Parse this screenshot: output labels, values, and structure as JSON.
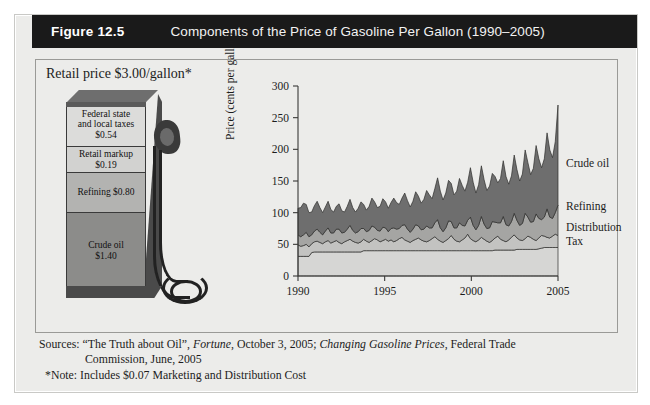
{
  "figure": {
    "number": "Figure 12.5",
    "title": "Components of the Price of Gasoline Per Gallon (1990–2005)"
  },
  "pump": {
    "retail_price_label": "Retail price $3.00/gallon*",
    "bands": [
      {
        "name": "tax",
        "line1": "Federal state",
        "line2": "and local taxes",
        "line3": "$0.54"
      },
      {
        "name": "markup",
        "line1": "Retail markup",
        "line2": "$0.19",
        "line3": ""
      },
      {
        "name": "refining",
        "line1": "Refining $0.80",
        "line2": "",
        "line3": ""
      },
      {
        "name": "crude",
        "line1": "Crude oil",
        "line2": "$1.40",
        "line3": ""
      }
    ]
  },
  "sources": {
    "line1_a": "Sources: “The Truth about Oil”, ",
    "line1_it1": "Fortune",
    "line1_b": ", October 3, 2005; ",
    "line1_it2": "Changing Gasoline Prices",
    "line1_c": ", Federal Trade",
    "line2": "Commission, June, 2005",
    "note": "*Note: Includes $0.07 Marketing and Distribution Cost"
  },
  "colors": {
    "crude": "#6e6e6e",
    "refining": "#a5a5a3",
    "distribution": "#c3c3c1",
    "tax": "#d6d6d4",
    "plot_bg": "#ececea",
    "axis": "#3a3a38",
    "title_bar": "#1a1a1a"
  },
  "chart_data": {
    "type": "area",
    "title": "Components of the Price of Gasoline Per Gallon (1990–2005)",
    "xlabel": "",
    "ylabel": "Price (cents per gallon)",
    "xlim": [
      1990,
      2005
    ],
    "ylim": [
      0,
      300
    ],
    "yticks": [
      0,
      50,
      100,
      150,
      200,
      250,
      300
    ],
    "xticks": [
      1990,
      1995,
      2000,
      2005
    ],
    "grid": false,
    "legend_position": "right-inline",
    "stacked": true,
    "series": [
      {
        "name": "Tax",
        "color": "#d6d6d4",
        "values": [
          31,
          31,
          31,
          31,
          31,
          37,
          38,
          38,
          38,
          38,
          38,
          38,
          38,
          38,
          38,
          38,
          38,
          38,
          38,
          38,
          38,
          38,
          38,
          38,
          40,
          40,
          40,
          40,
          40,
          40,
          40,
          40,
          40,
          40,
          40,
          40,
          40,
          40,
          40,
          40,
          40,
          40,
          40,
          40,
          40,
          40,
          40,
          40,
          40,
          40,
          40,
          40,
          40,
          40,
          40,
          40,
          40,
          40,
          40,
          40,
          40,
          40,
          40,
          40,
          40,
          40,
          40,
          40,
          40,
          40,
          40,
          40,
          41,
          41,
          41,
          41,
          41,
          41,
          41,
          41,
          42,
          42,
          42,
          42,
          42,
          42,
          42,
          42,
          43,
          44,
          45,
          45,
          45,
          45,
          45,
          45
        ]
      },
      {
        "name": "Distribution",
        "color": "#c3c3c1",
        "values": [
          18,
          16,
          17,
          19,
          15,
          14,
          16,
          17,
          15,
          13,
          16,
          18,
          14,
          16,
          18,
          15,
          13,
          16,
          18,
          20,
          17,
          15,
          14,
          16,
          18,
          15,
          13,
          16,
          19,
          17,
          14,
          16,
          18,
          15,
          17,
          14,
          16,
          19,
          21,
          17,
          15,
          13,
          16,
          18,
          20,
          17,
          15,
          14,
          16,
          19,
          22,
          18,
          15,
          13,
          16,
          19,
          24,
          18,
          15,
          14,
          17,
          20,
          26,
          19,
          16,
          14,
          17,
          21,
          18,
          15,
          13,
          16,
          19,
          22,
          17,
          15,
          13,
          16,
          20,
          24,
          18,
          15,
          14,
          17,
          21,
          19,
          16,
          14,
          17,
          20,
          18,
          16,
          15,
          18,
          21,
          19
        ]
      },
      {
        "name": "Refining",
        "color": "#a5a5a3",
        "values": [
          16,
          15,
          17,
          19,
          16,
          14,
          17,
          19,
          16,
          14,
          17,
          20,
          16,
          14,
          18,
          21,
          17,
          15,
          18,
          22,
          17,
          15,
          18,
          21,
          17,
          15,
          19,
          23,
          18,
          15,
          17,
          21,
          18,
          15,
          18,
          22,
          18,
          16,
          19,
          24,
          19,
          16,
          18,
          23,
          19,
          16,
          19,
          25,
          20,
          17,
          22,
          31,
          21,
          17,
          20,
          28,
          22,
          18,
          21,
          30,
          23,
          19,
          22,
          34,
          24,
          19,
          23,
          33,
          24,
          20,
          23,
          30,
          25,
          21,
          26,
          38,
          27,
          22,
          25,
          34,
          28,
          23,
          27,
          40,
          30,
          24,
          28,
          42,
          31,
          25,
          30,
          45,
          33,
          28,
          34,
          48
        ]
      },
      {
        "name": "Crude oil",
        "color": "#6e6e6e",
        "values": [
          42,
          46,
          50,
          44,
          38,
          36,
          40,
          44,
          39,
          35,
          38,
          42,
          37,
          33,
          36,
          40,
          35,
          32,
          36,
          41,
          36,
          33,
          37,
          42,
          38,
          34,
          38,
          44,
          40,
          36,
          39,
          45,
          41,
          37,
          41,
          47,
          42,
          38,
          43,
          50,
          45,
          40,
          44,
          52,
          47,
          42,
          47,
          56,
          52,
          46,
          54,
          66,
          58,
          50,
          55,
          64,
          60,
          52,
          58,
          70,
          63,
          55,
          60,
          78,
          68,
          58,
          64,
          80,
          70,
          60,
          66,
          76,
          72,
          63,
          70,
          88,
          76,
          66,
          72,
          92,
          80,
          70,
          78,
          100,
          86,
          75,
          84,
          108,
          94,
          82,
          92,
          120,
          106,
          96,
          112,
          158
        ]
      }
    ],
    "series_labels": [
      {
        "text": "Crude oil",
        "y_value": 175
      },
      {
        "text": "Refining",
        "y_value": 108
      },
      {
        "text": "Distribution",
        "y_value": 74
      },
      {
        "text": "Tax",
        "y_value": 52
      }
    ],
    "annotations": {
      "peak_year": 2005,
      "peak_total": 290,
      "start_total": 107
    }
  }
}
